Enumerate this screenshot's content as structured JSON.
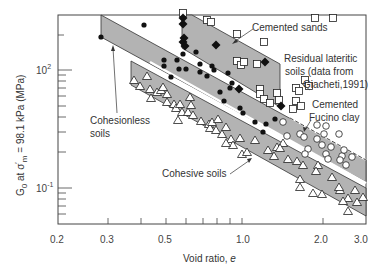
{
  "chart_data": {
    "type": "scatter",
    "title": "",
    "xlabel": "Void ratio, e",
    "ylabel": "G0 at σ'm = 98.1 kPa (MPa)",
    "xscale": "log",
    "yscale": "log",
    "xlim": [
      0.2,
      3.0
    ],
    "ylim": [
      5,
      290
    ],
    "x_ticks": [
      "0.2",
      "0.3",
      "0.5",
      "1.0",
      "2.0",
      "3.0"
    ],
    "y_ticks": [
      "10^2",
      "10^-1"
    ],
    "y_tick_labels_display": [
      {
        "base": "10",
        "exp": "2"
      },
      {
        "base": "10",
        "exp": "-1"
      }
    ],
    "grid": false,
    "bands": [
      {
        "name": "Cohesionless soils",
        "e_range": [
          0.29,
          3.0
        ],
        "G_upper": [
          290,
          17
        ],
        "G_lower": [
          185,
          10.5
        ],
        "fill": "#b3b3b3"
      },
      {
        "name": "Cohesive soils",
        "e_range": [
          0.42,
          3.0
        ],
        "G_upper": [
          125,
          9.5
        ],
        "G_lower": [
          75,
          5.5
        ],
        "fill": "#b3b3b3"
      },
      {
        "name": "Cemented sands",
        "e_range": [
          0.58,
          1.35
        ],
        "G_upper": [
          290,
          110
        ],
        "G_lower": [
          150,
          52
        ],
        "fill": "#b3b3b3"
      },
      {
        "name": "Cemented Fucino clay",
        "note": "dashed upper boundary",
        "e_range": [
          1.6,
          3.0
        ]
      }
    ],
    "series": [
      {
        "name": "Cohesionless soils",
        "marker": "filled-circle"
      },
      {
        "name": "Cemented sands",
        "marker": "filled-diamond"
      },
      {
        "name": "Residual lateritic soils (data from Giacheti,1991)",
        "marker": "open-square"
      },
      {
        "name": "Cemented Fucino clay",
        "marker": "open-circle"
      },
      {
        "name": "Cohesive soils",
        "marker": "open-triangle"
      }
    ],
    "annotations": [
      "Cemented sands",
      "Residual lateritic soils (data from Giacheti,1991)",
      "Cemented Fucino clay",
      "Cohesionless soils",
      "Cohesive soils"
    ]
  },
  "axes": {
    "xlabel_text": "Void ratio, ",
    "xlabel_var": "e",
    "ylabel": {
      "g": "G",
      "sub0": "0",
      "at": " at σ",
      "prime": "′",
      "sub_m": "m",
      "rest": " = 98.1 kPa (MPa)"
    },
    "x_ticks": [
      {
        "label": "0.2",
        "x": 58
      },
      {
        "label": "0.3",
        "x": 106
      },
      {
        "label": "0.5",
        "x": 164
      },
      {
        "label": "1.0",
        "x": 246
      },
      {
        "label": "2.0",
        "x": 323
      },
      {
        "label": "3.0",
        "x": 366
      }
    ],
    "y_ticks": [
      {
        "base": "10",
        "exp": "2",
        "y": 70
      },
      {
        "base": "10",
        "exp": "-1",
        "y": 188
      }
    ]
  },
  "labels": {
    "cemented_sands": "Cemented sands",
    "residual_1": "Residual lateritic",
    "residual_2": "soils (data from",
    "residual_3": "Giacheti,1991)",
    "fucino_1": "Cemented",
    "fucino_2": "Fucino clay",
    "cohesionless_1": "Cohesionless",
    "cohesionless_2": "soils",
    "cohesive": "Cohesive soils"
  },
  "markers": {
    "filled_circles": [
      [
        101,
        37
      ],
      [
        144,
        25
      ],
      [
        164,
        60
      ],
      [
        164,
        66
      ],
      [
        177,
        60
      ],
      [
        179,
        69
      ],
      [
        186,
        69
      ],
      [
        171,
        77
      ],
      [
        183,
        54
      ],
      [
        200,
        64
      ],
      [
        196,
        52
      ],
      [
        200,
        72
      ],
      [
        207,
        76
      ],
      [
        212,
        66
      ],
      [
        214,
        70
      ],
      [
        220,
        92
      ],
      [
        224,
        101
      ],
      [
        228,
        73
      ],
      [
        230,
        88
      ],
      [
        232,
        83
      ],
      [
        240,
        108
      ],
      [
        243,
        113
      ],
      [
        255,
        122
      ],
      [
        266,
        124
      ],
      [
        275,
        119
      ],
      [
        263,
        132
      ]
    ],
    "filled_diamonds": [
      [
        183,
        18
      ],
      [
        183,
        24
      ],
      [
        184,
        38
      ],
      [
        183,
        42
      ],
      [
        185,
        46
      ],
      [
        216,
        45
      ],
      [
        265,
        62
      ],
      [
        239,
        89
      ],
      [
        281,
        106
      ]
    ],
    "open_squares": [
      [
        183,
        13
      ],
      [
        207,
        20
      ],
      [
        211,
        22
      ],
      [
        237,
        34
      ],
      [
        264,
        42
      ],
      [
        237,
        61
      ],
      [
        241,
        65
      ],
      [
        244,
        62
      ],
      [
        257,
        64
      ],
      [
        260,
        89
      ],
      [
        260,
        94
      ],
      [
        264,
        99
      ],
      [
        270,
        103
      ],
      [
        277,
        93
      ],
      [
        279,
        100
      ],
      [
        315,
        18
      ],
      [
        333,
        18
      ],
      [
        296,
        88
      ],
      [
        305,
        80
      ],
      [
        299,
        91
      ],
      [
        309,
        86
      ],
      [
        296,
        101
      ],
      [
        301,
        106
      ],
      [
        293,
        109
      ]
    ],
    "open_circles": [
      [
        283,
        122
      ],
      [
        287,
        136
      ],
      [
        300,
        134
      ],
      [
        304,
        137
      ],
      [
        317,
        125
      ],
      [
        326,
        126
      ],
      [
        317,
        139
      ],
      [
        322,
        145
      ],
      [
        324,
        134
      ],
      [
        308,
        149
      ],
      [
        305,
        154
      ],
      [
        326,
        154
      ],
      [
        328,
        159
      ],
      [
        331,
        147
      ],
      [
        339,
        134
      ],
      [
        342,
        156
      ],
      [
        340,
        160
      ],
      [
        344,
        150
      ],
      [
        346,
        165
      ],
      [
        352,
        157
      ]
    ],
    "open_triangles": [
      [
        134,
        80
      ],
      [
        147,
        76
      ],
      [
        140,
        86
      ],
      [
        150,
        89
      ],
      [
        157,
        92
      ],
      [
        161,
        90
      ],
      [
        151,
        98
      ],
      [
        163,
        87
      ],
      [
        167,
        102
      ],
      [
        167,
        94
      ],
      [
        174,
        104
      ],
      [
        176,
        108
      ],
      [
        180,
        104
      ],
      [
        182,
        112
      ],
      [
        188,
        112
      ],
      [
        191,
        105
      ],
      [
        193,
        115
      ],
      [
        190,
        97
      ],
      [
        178,
        120
      ],
      [
        201,
        121
      ],
      [
        209,
        124
      ],
      [
        210,
        128
      ],
      [
        212,
        122
      ],
      [
        216,
        130
      ],
      [
        218,
        119
      ],
      [
        226,
        127
      ],
      [
        222,
        134
      ],
      [
        231,
        139
      ],
      [
        233,
        145
      ],
      [
        240,
        138
      ],
      [
        226,
        143
      ],
      [
        242,
        154
      ],
      [
        247,
        152
      ],
      [
        255,
        140
      ],
      [
        268,
        150
      ],
      [
        274,
        156
      ],
      [
        277,
        147
      ],
      [
        283,
        143
      ],
      [
        280,
        148
      ],
      [
        288,
        159
      ],
      [
        297,
        161
      ],
      [
        303,
        165
      ],
      [
        300,
        179
      ],
      [
        318,
        165
      ],
      [
        316,
        171
      ],
      [
        332,
        177
      ],
      [
        340,
        190
      ],
      [
        339,
        187
      ],
      [
        348,
        198
      ],
      [
        343,
        201
      ],
      [
        355,
        190
      ],
      [
        357,
        202
      ],
      [
        348,
        211
      ],
      [
        363,
        197
      ],
      [
        313,
        193
      ],
      [
        300,
        187
      ],
      [
        322,
        194
      ]
    ]
  }
}
